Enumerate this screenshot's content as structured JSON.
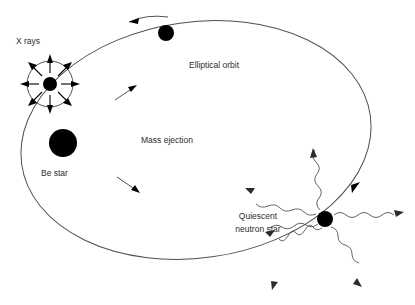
{
  "figure": {
    "background_color": "#ffffff",
    "line_color": "#4f4f4f",
    "body_color": "#000000",
    "text_color": "#2d2d2d",
    "width": 415,
    "height": 305
  },
  "labels": {
    "x_rays": "X rays",
    "be_star": "Be star",
    "elliptical_orbit": "Elliptical orbit",
    "mass_ejection": "Mass ejection",
    "neutron_star_line1": "Quiescent",
    "neutron_star_line2": "neutron star"
  },
  "objects": {
    "be_star": {
      "label": "Be star",
      "cx": 63,
      "cy": 143,
      "r": 14
    },
    "accreting_neutron_star": {
      "label": "X rays",
      "cx": 50,
      "cy": 84,
      "r": 7,
      "halo_r": 23,
      "ray_count": 8
    },
    "orbiting_dot_top": {
      "label": "neutron star on orbit",
      "cx": 166,
      "cy": 33,
      "r": 8
    },
    "quiescent_neutron_star": {
      "label": "Quiescent neutron star",
      "cx": 325,
      "cy": 219,
      "r": 8,
      "wave_count": 6
    }
  },
  "orbit": {
    "label": "Elliptical orbit",
    "cx": 196,
    "cy": 140,
    "rx": 176,
    "ry": 118,
    "rotation_deg": -8,
    "direction": "counterclockwise"
  },
  "orbit_direction_arrows": [
    {
      "name": "orbit-arrow-top",
      "x": 140,
      "y": 20,
      "angle": 196
    },
    {
      "name": "orbit-arrow-right",
      "x": 356,
      "y": 186,
      "angle": 302
    }
  ],
  "ejection_arrows": [
    {
      "name": "ejection-arrow-upper",
      "x": 128,
      "y": 92,
      "angle": 325
    },
    {
      "name": "ejection-arrow-lower",
      "x": 129,
      "y": 184,
      "angle": 35
    }
  ]
}
